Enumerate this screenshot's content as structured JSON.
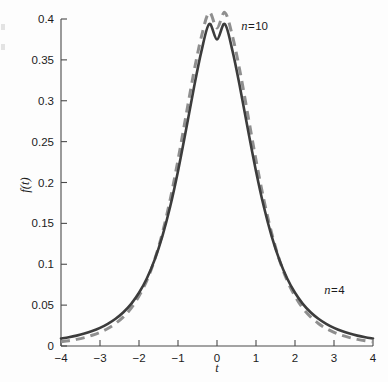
{
  "figure": {
    "name": "student-t-density-plot",
    "background_color": "#fdfdfd"
  },
  "chart_data": {
    "type": "line",
    "title": "",
    "subtitle": "",
    "xlabel": "t",
    "ylabel": "f(t)",
    "xlim": [
      -4,
      4
    ],
    "ylim": [
      0,
      0.4
    ],
    "grid": false,
    "legend_position": "inline-annotation",
    "xticks": [
      "-4",
      "-3",
      "-2",
      "-1",
      "0",
      "1",
      "2",
      "3",
      "4"
    ],
    "xtick_values": [
      -4,
      -3,
      -2,
      -1,
      0,
      1,
      2,
      3,
      4
    ],
    "yticks": [
      "0",
      "0.05",
      "0.1",
      "0.15",
      "0.2",
      "0.25",
      "0.3",
      "0.35",
      "0.4"
    ],
    "ytick_values": [
      0,
      0.05,
      0.1,
      0.15,
      0.2,
      0.25,
      0.3,
      0.35,
      0.4
    ],
    "annotations": [
      {
        "text": "n = 10",
        "symbol": "n",
        "equals": "=",
        "value": "10",
        "x": 0.62,
        "y": 0.386
      },
      {
        "text": "n = 4",
        "symbol": "n",
        "equals": "=",
        "value": "4",
        "x": 2.75,
        "y": 0.063
      }
    ],
    "series": [
      {
        "name": "n = 4",
        "style": "solid",
        "color": "#3c3c3c",
        "linewidth": 2.6,
        "x": [
          -4,
          -3.8,
          -3.6,
          -3.4,
          -3.2,
          -3,
          -2.8,
          -2.6,
          -2.4,
          -2.2,
          -2,
          -1.8,
          -1.6,
          -1.4,
          -1.2,
          -1,
          -0.8,
          -0.6,
          -0.4,
          -0.2,
          0,
          0.2,
          0.4,
          0.6,
          0.8,
          1,
          1.2,
          1.4,
          1.6,
          1.8,
          2,
          2.2,
          2.4,
          2.6,
          2.8,
          3,
          3.2,
          3.4,
          3.6,
          3.8,
          4
        ],
        "values": [
          0.0091,
          0.0107,
          0.0127,
          0.0152,
          0.0183,
          0.0222,
          0.0271,
          0.0333,
          0.0413,
          0.0516,
          0.0651,
          0.0826,
          0.1054,
          0.1345,
          0.1706,
          0.2139,
          0.2629,
          0.3139,
          0.3604,
          0.394,
          0.375,
          0.394,
          0.3604,
          0.3139,
          0.2629,
          0.2139,
          0.1706,
          0.1345,
          0.1054,
          0.0826,
          0.0651,
          0.0516,
          0.0413,
          0.0333,
          0.0271,
          0.0222,
          0.0183,
          0.0152,
          0.0127,
          0.0107,
          0.0091
        ]
      },
      {
        "name": "n = 10",
        "style": "dashed",
        "color": "#8f8f8f",
        "linewidth": 3.0,
        "x": [
          -4,
          -3.8,
          -3.6,
          -3.4,
          -3.2,
          -3,
          -2.8,
          -2.6,
          -2.4,
          -2.2,
          -2,
          -1.8,
          -1.6,
          -1.4,
          -1.2,
          -1,
          -0.8,
          -0.6,
          -0.4,
          -0.2,
          0,
          0.2,
          0.4,
          0.6,
          0.8,
          1,
          1.2,
          1.4,
          1.6,
          1.8,
          2,
          2.2,
          2.4,
          2.6,
          2.8,
          3,
          3.2,
          3.4,
          3.6,
          3.8,
          4
        ],
        "values": [
          0.0051,
          0.0064,
          0.0081,
          0.0103,
          0.0131,
          0.0167,
          0.0214,
          0.0276,
          0.0357,
          0.0463,
          0.0611,
          0.08,
          0.1054,
          0.1383,
          0.1792,
          0.2275,
          0.2804,
          0.3332,
          0.3783,
          0.408,
          0.389,
          0.408,
          0.3783,
          0.3332,
          0.2804,
          0.2275,
          0.1792,
          0.1383,
          0.1054,
          0.08,
          0.0611,
          0.0463,
          0.0357,
          0.0276,
          0.0214,
          0.0167,
          0.0131,
          0.0103,
          0.0081,
          0.0064,
          0.0051
        ]
      }
    ]
  }
}
